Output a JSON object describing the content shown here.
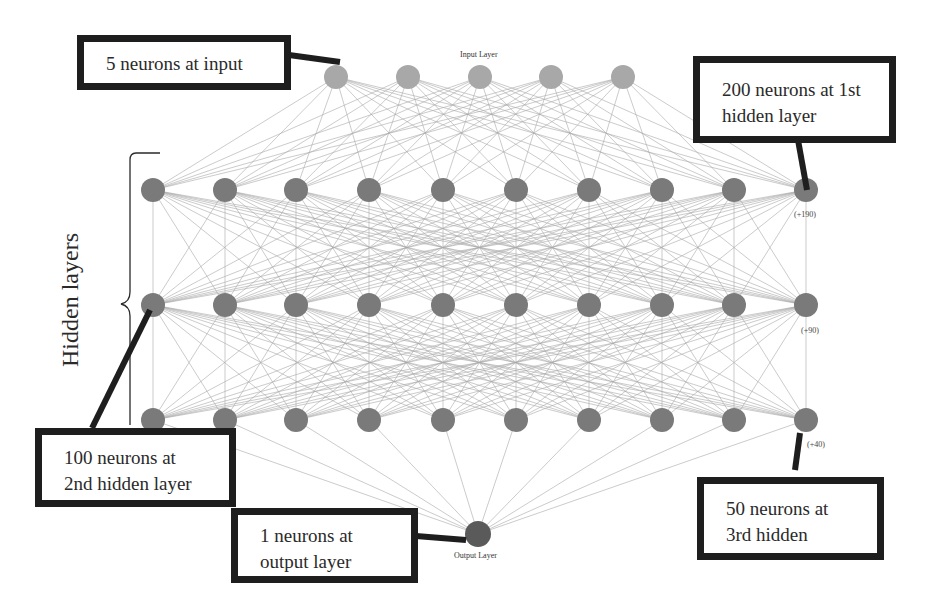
{
  "diagram": {
    "type": "neural-network-architecture",
    "layers": [
      {
        "name": "Input Layer",
        "label": "Input Layer",
        "neurons": 5,
        "visible_nodes": 5,
        "color": "#a8a8a8",
        "x": [
          336,
          408,
          480,
          551,
          623
        ],
        "y": 77
      },
      {
        "name": "Hidden 1",
        "neurons": 200,
        "visible_nodes": 10,
        "overflow_label": "(+190)",
        "color": "#7a7a7a",
        "x": [
          153,
          225,
          296,
          369,
          443,
          516,
          589,
          662,
          734,
          806
        ],
        "y": 190
      },
      {
        "name": "Hidden 2",
        "neurons": 100,
        "visible_nodes": 10,
        "overflow_label": "(+90)",
        "color": "#7a7a7a",
        "x": [
          153,
          225,
          296,
          369,
          443,
          516,
          589,
          662,
          734,
          806
        ],
        "y": 305
      },
      {
        "name": "Hidden 3",
        "neurons": 50,
        "visible_nodes": 10,
        "overflow_label": "(+40)",
        "color": "#7a7a7a",
        "x": [
          153,
          225,
          296,
          369,
          443,
          516,
          589,
          662,
          734,
          806
        ],
        "y": 420
      },
      {
        "name": "Output Layer",
        "label": "Output Layer",
        "neurons": 1,
        "visible_nodes": 1,
        "color": "#5a5a5a",
        "x": [
          478
        ],
        "y": 534
      }
    ],
    "labels": {
      "input_layer": "Input Layer",
      "output_layer": "Output Layer",
      "hidden1_more": "(+190)",
      "hidden2_more": "(+90)",
      "hidden3_more": "(+40)",
      "hidden_layers_bracket": "Hidden layers"
    },
    "callouts": {
      "input": {
        "line1": "5 neurons at input",
        "line2": ""
      },
      "hidden1": {
        "line1": "200 neurons at 1st",
        "line2": "hidden layer"
      },
      "hidden2": {
        "line1": "100 neurons at",
        "line2": "2nd hidden layer"
      },
      "hidden3": {
        "line1": "50 neurons at",
        "line2": "3rd hidden"
      },
      "output": {
        "line1": "1 neurons at",
        "line2": "output layer"
      }
    },
    "colors": {
      "edge": "#9a9a9a",
      "callout_border": "#1e1e1e",
      "background": "#ffffff"
    }
  }
}
